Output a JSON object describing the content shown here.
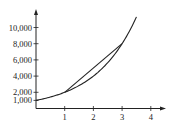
{
  "chart_data": {
    "type": "line",
    "title": "",
    "xlabel": "",
    "ylabel": "",
    "x_ticks": [
      "1",
      "2",
      "3",
      "4"
    ],
    "y_ticks": [
      "1,000",
      "2,000",
      "4,000",
      "6,000",
      "8,000",
      "10,000"
    ],
    "xlim": [
      0,
      4.4
    ],
    "ylim": [
      0,
      12000
    ],
    "grid": false,
    "legend": null,
    "series": [
      {
        "name": "exponential curve",
        "x": [
          0,
          0.5,
          1,
          1.5,
          2,
          2.5,
          3,
          3.5
        ],
        "values": [
          1000,
          1414,
          2000,
          2828,
          4000,
          5657,
          8000,
          11314
        ]
      },
      {
        "name": "secant line",
        "x": [
          1,
          3
        ],
        "values": [
          2000,
          8000
        ]
      }
    ],
    "colors": {
      "line": "#222222",
      "axis": "#222222"
    }
  }
}
